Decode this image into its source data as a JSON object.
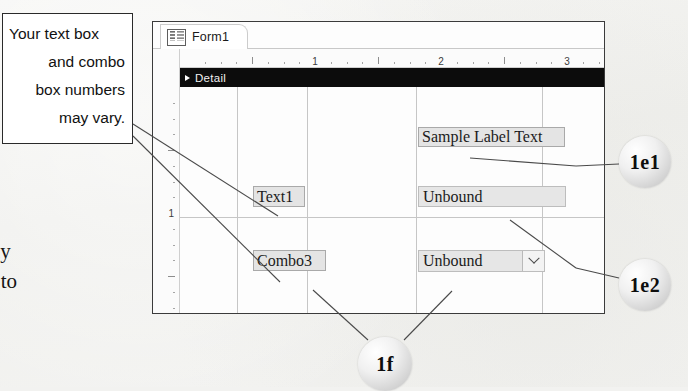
{
  "callout_note": {
    "name": "callout-note",
    "lines": [
      "Your text box",
      "and combo",
      "box numbers",
      "may vary."
    ]
  },
  "body_text": {
    "lines": [
      "apply",
      "lied to",
      "1d.",
      "sign",
      "n"
    ]
  },
  "access_window": {
    "tab": {
      "label": "Form1",
      "icon": "form-design-icon"
    },
    "h_ruler": {
      "numbers": [
        "1",
        "2",
        "3"
      ]
    },
    "v_ruler": {
      "numbers": [
        "1"
      ]
    },
    "detail_section": {
      "label": "Detail",
      "expander_icon": "section-expander-triangle-icon"
    },
    "controls": [
      {
        "id": "sample-label",
        "kind": "label",
        "text": "Sample Label Text",
        "x": 238,
        "y": 40,
        "w": 147,
        "h": 20
      },
      {
        "id": "text1-label",
        "kind": "label",
        "text": "Text1",
        "x": 73,
        "y": 99,
        "w": 52,
        "h": 21
      },
      {
        "id": "unbound-textbox",
        "kind": "textbox",
        "text": "Unbound",
        "x": 238,
        "y": 99,
        "w": 148,
        "h": 21
      },
      {
        "id": "combo3-label",
        "kind": "label",
        "text": "Combo3",
        "x": 73,
        "y": 163,
        "w": 73,
        "h": 21
      },
      {
        "id": "unbound-combobox",
        "kind": "combobox",
        "text": "Unbound",
        "x": 238,
        "y": 163,
        "w": 127,
        "h": 22,
        "dropdown_icon": "chevron-down-icon"
      }
    ]
  },
  "callout_circles": [
    {
      "id": "callout-1e1",
      "label": "1e1",
      "cx": 645,
      "cy": 162,
      "r": 26
    },
    {
      "id": "callout-1e2",
      "label": "1e2",
      "cx": 645,
      "cy": 285,
      "r": 26
    },
    {
      "id": "callout-1f",
      "label": "1f",
      "cx": 385,
      "cy": 364,
      "r": 27
    }
  ],
  "colors": {
    "window_border": "#3b3b3b",
    "detail_bar": "#0c0c0c",
    "control_fill": "#e6e6e6",
    "note_border": "#2a2a2a",
    "leader_line": "#4a4a4a"
  }
}
